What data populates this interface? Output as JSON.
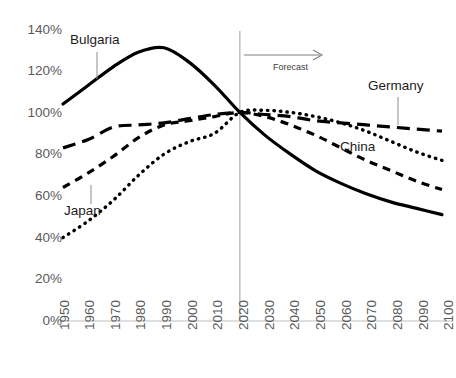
{
  "chart_data": {
    "type": "line",
    "title": "",
    "subtitle": "",
    "xlabel": "",
    "ylabel": "",
    "xlim": [
      1950,
      2100
    ],
    "ylim": [
      0,
      140
    ],
    "grid": false,
    "legend_position": "inline-annotations",
    "y_tick_labels": [
      "140%",
      "120%",
      "100%",
      "80%",
      "60%",
      "40%",
      "20%",
      "0%"
    ],
    "y_tick_values": [
      140,
      120,
      100,
      80,
      60,
      40,
      20,
      0
    ],
    "x_tick_labels": [
      "1950",
      "1960",
      "1970",
      "1980",
      "1990",
      "2000",
      "2010",
      "2020",
      "2030",
      "2040",
      "2050",
      "2060",
      "2070",
      "2080",
      "2090",
      "2100"
    ],
    "x_tick_values": [
      1950,
      1960,
      1970,
      1980,
      1990,
      2000,
      2010,
      2020,
      2030,
      2040,
      2050,
      2060,
      2070,
      2080,
      2090,
      2100
    ],
    "x": [
      1950,
      1960,
      1970,
      1980,
      1990,
      2000,
      2010,
      2020,
      2030,
      2040,
      2050,
      2060,
      2070,
      2080,
      2090,
      2100
    ],
    "series": [
      {
        "name": "Bulgaria",
        "style": "solid",
        "color": "#000000",
        "values": [
          104,
          113,
          122,
          129,
          131,
          124,
          113,
          100,
          89,
          80,
          72,
          66,
          61,
          57,
          54,
          51
        ]
      },
      {
        "name": "Germany",
        "style": "long-dash",
        "color": "#000000",
        "values": [
          83,
          87,
          93,
          94,
          95,
          97,
          99,
          100,
          99,
          98,
          96,
          95,
          94,
          93,
          92,
          91
        ]
      },
      {
        "name": "China",
        "style": "short-dash",
        "color": "#000000",
        "values": [
          64,
          71,
          79,
          88,
          94,
          96,
          98,
          100,
          98,
          94,
          89,
          83,
          77,
          72,
          67,
          63
        ]
      },
      {
        "name": "Japan",
        "style": "dotted",
        "color": "#000000",
        "values": [
          40,
          48,
          58,
          70,
          80,
          86,
          90,
          100,
          101,
          100,
          98,
          95,
          91,
          86,
          81,
          77
        ]
      }
    ],
    "annotations": [
      {
        "name": "Bulgaria",
        "label": "Bulgaria",
        "kind": "series-callout"
      },
      {
        "name": "Japan",
        "label": "Japan",
        "kind": "series-callout"
      },
      {
        "name": "Germany",
        "label": "Germany",
        "kind": "series-callout"
      },
      {
        "name": "China",
        "label": "China",
        "kind": "series-callout"
      },
      {
        "name": "Forecast",
        "label": "Forecast",
        "kind": "arrow-annotation",
        "at_x": 2020
      }
    ],
    "forecast_divider_year": 2020,
    "forecast_label": "Forecast",
    "axis_color": "#bfbfbf",
    "tick_label_color": "#5a5a5a",
    "divider_color": "#a6a6a6"
  },
  "labels": {
    "bulgaria": "Bulgaria",
    "japan": "Japan",
    "germany": "Germany",
    "china": "China",
    "forecast": "Forecast"
  }
}
